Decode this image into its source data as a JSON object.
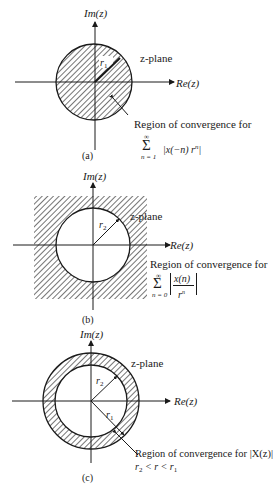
{
  "figure": {
    "panels": [
      {
        "id": "a",
        "caption": "(a)",
        "im_axis": "Im(z)",
        "re_axis": "Re(z)",
        "plane_label": "z-plane",
        "radius_label": "r",
        "radius_sub": "1",
        "roc_text": "Region of convergence for",
        "sum_symbol": "Σ",
        "sum_upper": "∞",
        "sum_lower": "n = 1",
        "sum_expr": "|x(−n) r",
        "sum_expr_sup": "n",
        "sum_expr_end": "|",
        "region": "interior disk |z| < r1 (hatched)"
      },
      {
        "id": "b",
        "caption": "(b)",
        "im_axis": "Im(z)",
        "re_axis": "Re(z)",
        "plane_label": "z-plane",
        "radius_label": "r",
        "radius_sub": "2",
        "roc_text": "Region of convergence for",
        "sum_symbol": "Σ",
        "sum_upper": "∞",
        "sum_lower": "n = 0",
        "frac_num": "x(n)",
        "frac_den": "r",
        "frac_den_sup": "n",
        "region": "exterior |z| > r2 (hatched)"
      },
      {
        "id": "c",
        "caption": "(c)",
        "im_axis": "Im(z)",
        "re_axis": "Re(z)",
        "plane_label": "z-plane",
        "r1_label": "r",
        "r1_sub": "1",
        "r2_label": "r",
        "r2_sub": "2",
        "roc_text": "Region of convergence for |X(z)|",
        "ineq_r2": "r",
        "ineq_r2_sub": "2",
        "ineq_mid": " < r < ",
        "ineq_r1": "r",
        "ineq_r1_sub": "1",
        "region": "annulus r2 < |z| < r1 (hatched)"
      }
    ]
  }
}
